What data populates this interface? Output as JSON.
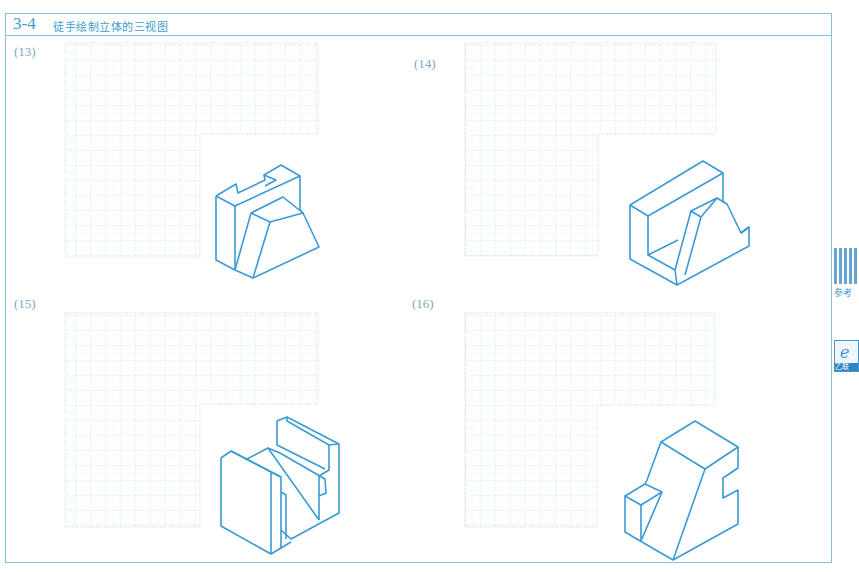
{
  "header": {
    "section_number": "3-4",
    "title": "徒手绘制立体的三视图"
  },
  "exercises": [
    {
      "label": "(13)",
      "grid": "l-shaped-sketch-grid",
      "figure": "isometric-block-with-notched-back-and-trapezoid-front"
    },
    {
      "label": "(14)",
      "grid": "l-shaped-sketch-grid",
      "figure": "isometric-u-channel-with-ramp-rib"
    },
    {
      "label": "(15)",
      "grid": "l-shaped-sketch-grid",
      "figure": "isometric-block-with-slot-and-diagonal-cut"
    },
    {
      "label": "(16)",
      "grid": "l-shaped-sketch-grid",
      "figure": "isometric-stepped-block-with-slant-face"
    }
  ],
  "side_panel": {
    "qr_label": "参考",
    "app_label": "乙联"
  },
  "colors": {
    "frame": "#86c3e3",
    "accent": "#3d9ccf",
    "figure_line": "#3a9ad6",
    "grid_line": "#b9d9ec"
  }
}
